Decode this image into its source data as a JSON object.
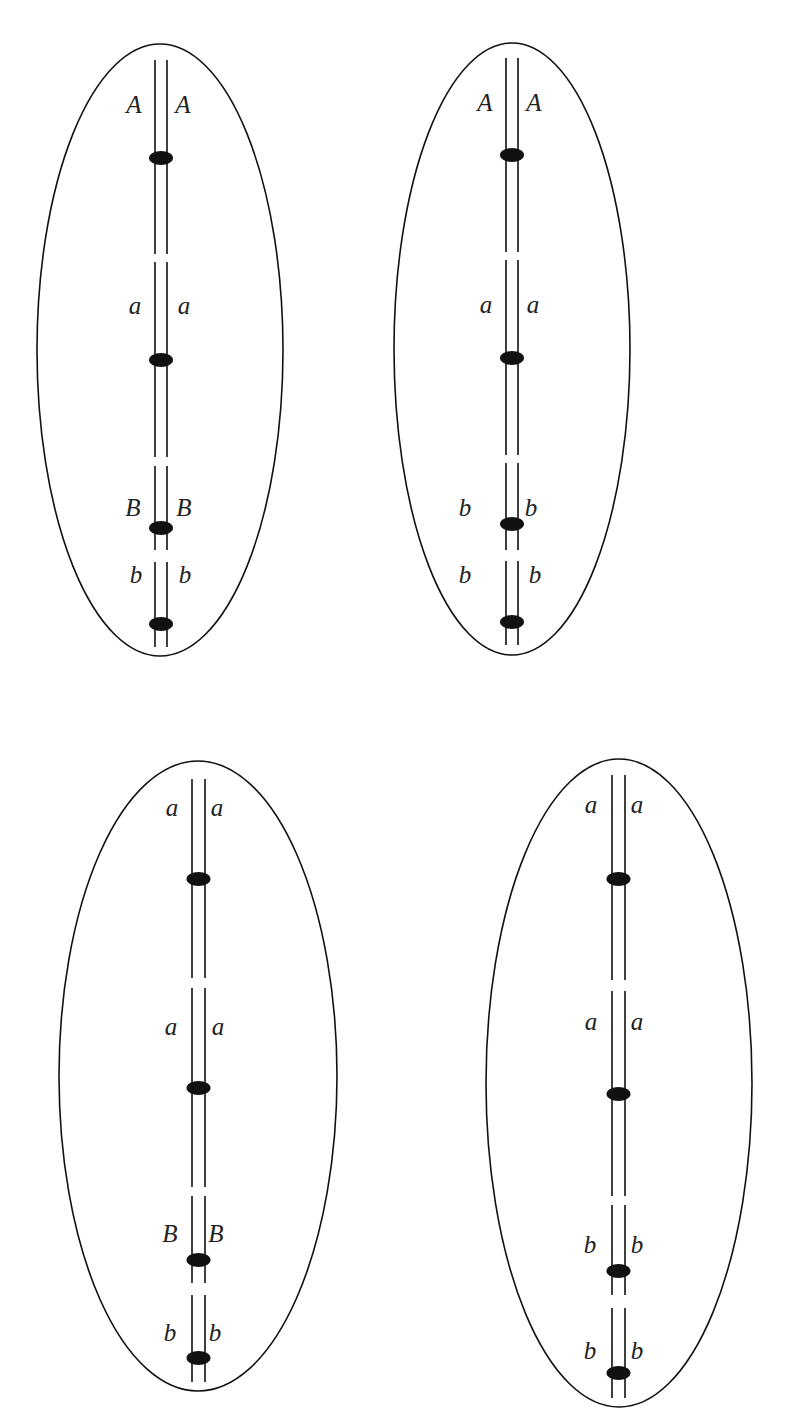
{
  "figure": {
    "colors": {
      "line": "#111111",
      "text": "#222222",
      "background": "#ffffff"
    },
    "cells": [
      {
        "id": "top-left",
        "ellipse": {
          "cx": 160,
          "cy": 350,
          "rx": 123,
          "ry": 306
        },
        "chromatid_x": [
          155,
          167
        ],
        "line_top": 60,
        "line_bottom": 647,
        "gaps": [
          [
            254,
            262
          ],
          [
            457,
            466
          ],
          [
            550,
            562
          ]
        ],
        "centromeres": [
          158,
          360,
          528,
          624
        ],
        "labels": [
          {
            "left": "A",
            "right": "A",
            "y": 107,
            "lx": 134,
            "rx": 183
          },
          {
            "left": "a",
            "right": "a",
            "y": 308,
            "lx": 135,
            "rx": 184
          },
          {
            "left": "B",
            "right": "B",
            "y": 510,
            "lx": 133,
            "rx": 184
          },
          {
            "left": "b",
            "right": "b",
            "y": 577,
            "lx": 136,
            "rx": 185
          }
        ]
      },
      {
        "id": "top-right",
        "ellipse": {
          "cx": 512,
          "cy": 349,
          "rx": 118,
          "ry": 306
        },
        "chromatid_x": [
          506,
          518
        ],
        "line_top": 58,
        "line_bottom": 645,
        "gaps": [
          [
            252,
            260
          ],
          [
            455,
            463
          ],
          [
            550,
            561
          ]
        ],
        "centromeres": [
          155,
          358,
          524,
          622
        ],
        "labels": [
          {
            "left": "A",
            "right": "A",
            "y": 105,
            "lx": 485,
            "rx": 534
          },
          {
            "left": "a",
            "right": "a",
            "y": 307,
            "lx": 486,
            "rx": 533
          },
          {
            "left": "b",
            "right": "b",
            "y": 510,
            "lx": 465,
            "rx": 531
          },
          {
            "left": "b",
            "right": "b",
            "y": 577,
            "lx": 465,
            "rx": 535
          }
        ]
      },
      {
        "id": "bottom-left",
        "ellipse": {
          "cx": 198,
          "cy": 1076,
          "rx": 139,
          "ry": 315
        },
        "chromatid_x": [
          192,
          205
        ],
        "line_top": 779,
        "line_bottom": 1382,
        "gaps": [
          [
            978,
            988
          ],
          [
            1187,
            1196
          ],
          [
            1283,
            1295
          ]
        ],
        "centromeres": [
          879,
          1088,
          1260,
          1358
        ],
        "labels": [
          {
            "left": "a",
            "right": "a",
            "y": 810,
            "lx": 172,
            "rx": 217
          },
          {
            "left": "a",
            "right": "a",
            "y": 1029,
            "lx": 171,
            "rx": 218
          },
          {
            "left": "B",
            "right": "B",
            "y": 1236,
            "lx": 170,
            "rx": 216
          },
          {
            "left": "b",
            "right": "b",
            "y": 1335,
            "lx": 170,
            "rx": 215
          }
        ]
      },
      {
        "id": "bottom-right",
        "ellipse": {
          "cx": 619,
          "cy": 1083,
          "rx": 133,
          "ry": 324
        },
        "chromatid_x": [
          612,
          625
        ],
        "line_top": 775,
        "line_bottom": 1398,
        "gaps": [
          [
            980,
            991
          ],
          [
            1196,
            1205
          ],
          [
            1295,
            1308
          ]
        ],
        "centromeres": [
          879,
          1094,
          1271,
          1373
        ],
        "labels": [
          {
            "left": "a",
            "right": "a",
            "y": 807,
            "lx": 591,
            "rx": 637
          },
          {
            "left": "a",
            "right": "a",
            "y": 1024,
            "lx": 591,
            "rx": 637
          },
          {
            "left": "b",
            "right": "b",
            "y": 1247,
            "lx": 590,
            "rx": 637
          },
          {
            "left": "b",
            "right": "b",
            "y": 1353,
            "lx": 590,
            "rx": 637
          }
        ]
      }
    ]
  }
}
